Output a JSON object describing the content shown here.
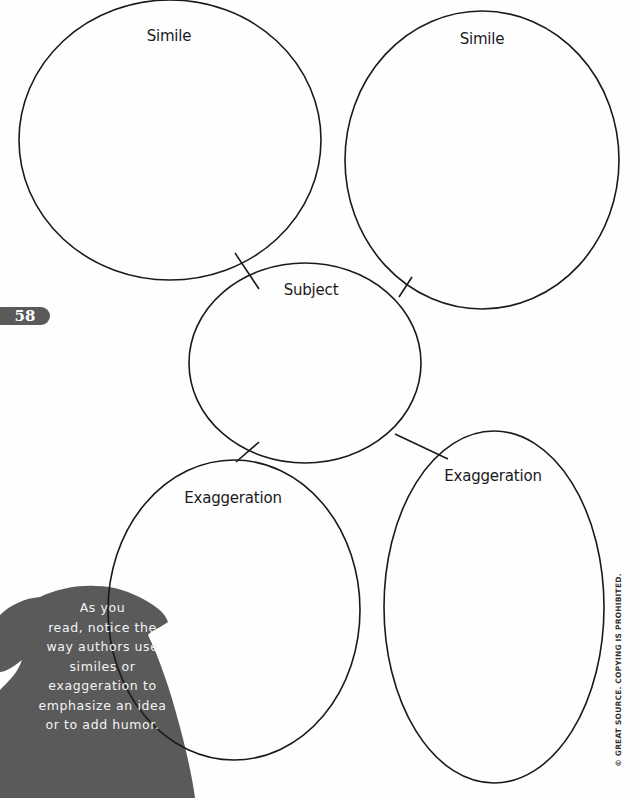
{
  "page": {
    "page_number": "58",
    "copyright": "© GREAT SOURCE. COPYING IS PROHIBITED."
  },
  "diagram": {
    "type": "web organizer",
    "nodes": [
      {
        "id": "simile-1",
        "label": "Simile"
      },
      {
        "id": "simile-2",
        "label": "Simile"
      },
      {
        "id": "subject",
        "label": "Subject"
      },
      {
        "id": "exaggeration-1",
        "label": "Exaggeration"
      },
      {
        "id": "exaggeration-2",
        "label": "Exaggeration"
      }
    ]
  },
  "sidebar_note": {
    "lines": [
      "As you",
      "read, notice the",
      "way authors use",
      "similes or",
      "exaggeration to",
      "emphasize an idea",
      "or to add humor."
    ]
  },
  "colors": {
    "line": "#1a1a1a",
    "silhouette": "#5a5a5a",
    "page_tab": "#5a5a5a"
  }
}
